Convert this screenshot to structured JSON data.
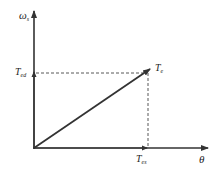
{
  "diagram": {
    "y_axis_label": "ω",
    "y_axis_label_sub": "s",
    "x_axis_label": "θ",
    "point_label": "T",
    "point_label_sub": "e",
    "y_marker_label": "T",
    "y_marker_label_sub": "ed",
    "x_marker_label": "T",
    "x_marker_label_sub": "es",
    "colors": {
      "axis": "#333333",
      "vector": "#333333",
      "dashed": "#444444",
      "background": "#ffffff"
    }
  }
}
